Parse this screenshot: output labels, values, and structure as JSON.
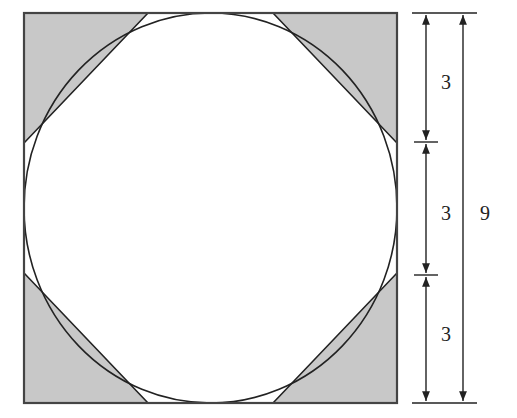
{
  "diagram": {
    "colors": {
      "shade": "#c8c8c8",
      "stroke": "#222222",
      "background": "#ffffff"
    },
    "dimensions": {
      "segment_labels": [
        "3",
        "3",
        "3"
      ],
      "total_label": "9"
    }
  }
}
